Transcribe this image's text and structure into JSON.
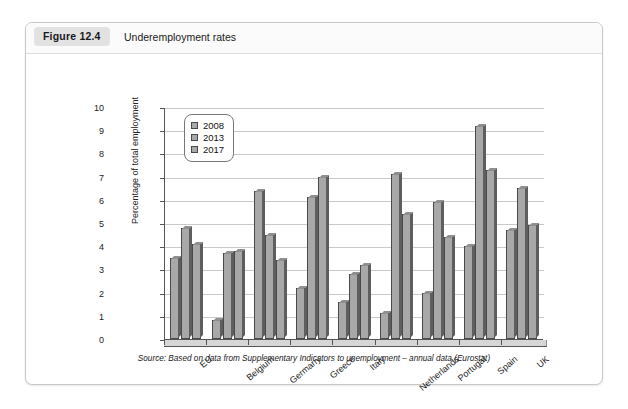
{
  "running_header": "",
  "figure": {
    "tag": "Figure 12.4",
    "caption": "Underemployment rates",
    "source": "Source: Based on data from Supplementary Indicators to unemployment – annual data (Eurostat)"
  },
  "chart_data": {
    "type": "bar",
    "title": "Underemployment rates",
    "xlabel": "",
    "ylabel": "Percentage of total employment",
    "ylim": [
      0,
      10
    ],
    "yticks": [
      0,
      1,
      2,
      3,
      4,
      5,
      6,
      7,
      8,
      9,
      10
    ],
    "grid": true,
    "legend_position": "top-left",
    "categories": [
      "EU",
      "Belgium",
      "Germany",
      "Greece",
      "Italy",
      "Netherlands",
      "Portugal",
      "Spain",
      "UK"
    ],
    "series": [
      {
        "name": "2008",
        "values": [
          3.5,
          0.8,
          6.4,
          2.2,
          1.6,
          1.1,
          2.0,
          4.0,
          4.7
        ]
      },
      {
        "name": "2013",
        "values": [
          4.8,
          3.7,
          4.5,
          6.1,
          2.8,
          7.1,
          5.9,
          9.2,
          6.5
        ]
      },
      {
        "name": "2017",
        "values": [
          4.1,
          3.8,
          3.4,
          7.0,
          3.2,
          5.4,
          4.4,
          7.3,
          4.9
        ]
      }
    ],
    "colors": {
      "bar_face": "#a8a8a8",
      "bar_side": "#5e5e5e",
      "bar_outline": "#4a4a4a",
      "grid": "#c9c9c9",
      "axis": "#555555"
    }
  }
}
